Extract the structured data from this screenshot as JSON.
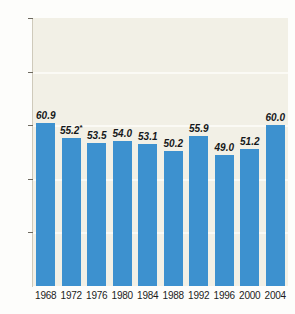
{
  "chart_data": {
    "type": "bar",
    "title": "",
    "subtitle": "",
    "xlabel": "",
    "ylabel": "",
    "categories": [
      "1968",
      "1972",
      "1976",
      "1980",
      "1984",
      "1988",
      "1992",
      "1996",
      "2000",
      "2004"
    ],
    "values": [
      60.9,
      55.2,
      53.5,
      54.0,
      53.1,
      50.2,
      55.9,
      49.0,
      51.2,
      60.0
    ],
    "value_labels": [
      "60.9",
      "55.2",
      "53.5",
      "54.0",
      "53.1",
      "50.2",
      "55.9",
      "49.0",
      "51.2",
      "60.0"
    ],
    "annotations": [
      {
        "category": "1972",
        "marker": "*"
      }
    ],
    "ylim": [
      0,
      100
    ],
    "yticks": [
      20,
      40,
      60,
      80,
      100
    ],
    "ytick_labels": [
      "20",
      "40",
      "60",
      "80",
      "100"
    ],
    "grid": true,
    "gridlines_at": [
      20,
      40,
      60,
      80
    ],
    "legend": null,
    "series": [
      {
        "name": "",
        "values": [
          60.9,
          55.2,
          53.5,
          54.0,
          53.1,
          50.2,
          55.9,
          49.0,
          51.2,
          60.0
        ]
      }
    ],
    "colors": {
      "bar": "#3d91cf",
      "plot_background": "#f2f0e6",
      "gridline": "#fbfaf5",
      "page_background": "#fdfdfb",
      "axis_text": "#1c1c1c",
      "value_label": "#16181a"
    }
  }
}
